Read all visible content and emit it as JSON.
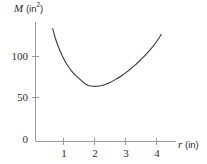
{
  "figure": {
    "background_color": "#ffffff",
    "ink_color": "#2b2b2b",
    "axis_color": "#9a9a9a",
    "curve_color": "#3a3a3a"
  },
  "axes": {
    "y": {
      "label_variable": "M",
      "label_unit_open": "(in",
      "label_unit_sup": "2",
      "label_unit_close": ")",
      "label_full": "M (in2)",
      "ticks": [
        "100",
        "50",
        "0"
      ],
      "tick_values": [
        100,
        50,
        0
      ]
    },
    "x": {
      "label_variable": "r",
      "label_unit": "(in)",
      "label_full": "r (in)",
      "ticks": [
        "1",
        "2",
        "3",
        "4"
      ],
      "tick_values": [
        1,
        2,
        3,
        4
      ]
    }
  },
  "chart_data": {
    "type": "line",
    "title": "",
    "subtitle": "",
    "xlabel": "r (in)",
    "ylabel": "M (in^2)",
    "xlim": [
      0,
      4.55
    ],
    "ylim": [
      0,
      145
    ],
    "xticks": [
      1,
      2,
      3,
      4
    ],
    "yticks": [
      0,
      50,
      100
    ],
    "grid": false,
    "legend": null,
    "annotations": [],
    "series": [
      {
        "name": "M(r)",
        "description": "U-shaped surface-area curve with a single interior minimum near r = 1.8 in, M = 65 in^2",
        "x": [
          0.65,
          0.75,
          0.85,
          0.95,
          1.05,
          1.15,
          1.25,
          1.4,
          1.55,
          1.7,
          1.8,
          1.95,
          2.1,
          2.3,
          2.5,
          2.7,
          2.9,
          3.1,
          3.3,
          3.5,
          3.7,
          3.9,
          4.05,
          4.15
        ],
        "y": [
          133.0,
          120.0,
          110.0,
          101.5,
          94.5,
          88.5,
          83.5,
          77.5,
          72.5,
          68.0,
          66.0,
          65.0,
          65.0,
          66.5,
          69.5,
          73.5,
          78.0,
          83.5,
          89.5,
          96.5,
          104.0,
          112.5,
          120.0,
          126.0
        ]
      }
    ],
    "minimum": {
      "x": 1.85,
      "y": 65
    }
  }
}
